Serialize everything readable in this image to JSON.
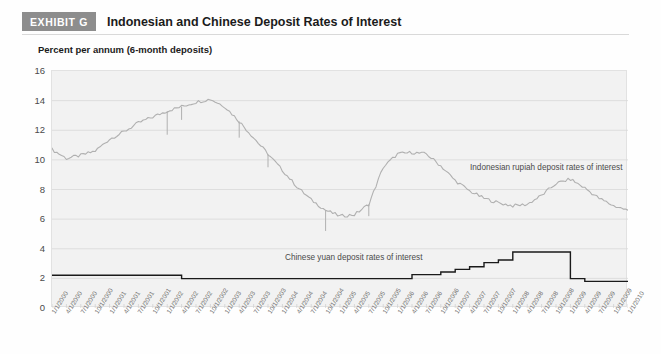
{
  "header": {
    "badge": "EXHIBIT G",
    "title": "Indonesian and Chinese Deposit Rates of Interest"
  },
  "axis_title": "Percent per annum (6-month deposits)",
  "chart_data": {
    "type": "line",
    "title": "Indonesian and Chinese Deposit Rates of Interest",
    "subtitle": "Percent per annum (6-month deposits)",
    "xlabel": "",
    "ylabel": "Percent per annum (6-month deposits)",
    "ylim": [
      0,
      16
    ],
    "yticks": [
      0,
      2,
      4,
      6,
      8,
      10,
      12,
      14,
      16
    ],
    "grid": true,
    "legend_position": "inline-annotation",
    "x": [
      "1/1/2000",
      "4/1/2000",
      "7/1/2000",
      "10/1/2000",
      "1/1/2001",
      "4/1/2001",
      "7/1/2001",
      "10/1/2001",
      "1/1/2002",
      "4/1/2002",
      "7/1/2002",
      "10/1/2002",
      "1/1/2003",
      "4/1/2003",
      "7/1/2003",
      "10/1/2003",
      "1/1/2004",
      "4/1/2004",
      "7/1/2004",
      "10/1/2004",
      "1/1/2005",
      "4/1/2005",
      "7/1/2005",
      "10/1/2005",
      "1/1/2006",
      "4/1/2006",
      "7/1/2006",
      "10/1/2006",
      "1/1/2007",
      "4/1/2007",
      "7/1/2007",
      "10/1/2007",
      "1/1/2008",
      "4/1/2008",
      "7/1/2008",
      "10/1/2008",
      "1/1/2009",
      "4/1/2009",
      "7/1/2009",
      "10/1/2009",
      "1/1/2010"
    ],
    "series": [
      {
        "name": "Indonesian rupiah deposit rates of interest",
        "color": "#b0b0b0",
        "values": [
          10.7,
          10.1,
          10.3,
          10.6,
          11.4,
          11.9,
          12.5,
          12.9,
          13.3,
          13.6,
          13.9,
          14.1,
          13.6,
          12.6,
          11.5,
          10.4,
          9.3,
          8.2,
          7.3,
          6.6,
          6.2,
          6.3,
          7.0,
          9.5,
          10.4,
          10.5,
          10.4,
          9.6,
          8.6,
          7.9,
          7.4,
          7.1,
          6.9,
          7.0,
          7.6,
          8.4,
          8.7,
          8.1,
          7.4,
          6.9,
          6.6
        ]
      },
      {
        "name": "Chinese yuan deposit rates of interest",
        "color": "#1a1a1a",
        "values": [
          2.21,
          2.21,
          2.21,
          2.21,
          2.21,
          2.21,
          2.21,
          2.21,
          2.21,
          1.98,
          1.98,
          1.98,
          1.98,
          1.98,
          1.98,
          1.98,
          1.98,
          1.98,
          1.98,
          1.98,
          1.98,
          1.98,
          1.98,
          1.98,
          1.98,
          2.25,
          2.25,
          2.43,
          2.61,
          2.78,
          3.06,
          3.24,
          3.78,
          3.78,
          3.78,
          3.78,
          1.98,
          1.8,
          1.8,
          1.8,
          1.8
        ]
      }
    ],
    "annotations": [
      {
        "name": "indonesia-series-label",
        "text": "Indonesian rupiah deposit rates of interest"
      },
      {
        "name": "china-series-label",
        "text": "Chinese yuan deposit rates of interest"
      }
    ]
  },
  "colors": {
    "badge_bg": "#8d8d8d",
    "plot_bg": "#f2f2f2",
    "grid": "#d8d8d8",
    "indonesia_line": "#b0b0b0",
    "china_line": "#1a1a1a"
  }
}
